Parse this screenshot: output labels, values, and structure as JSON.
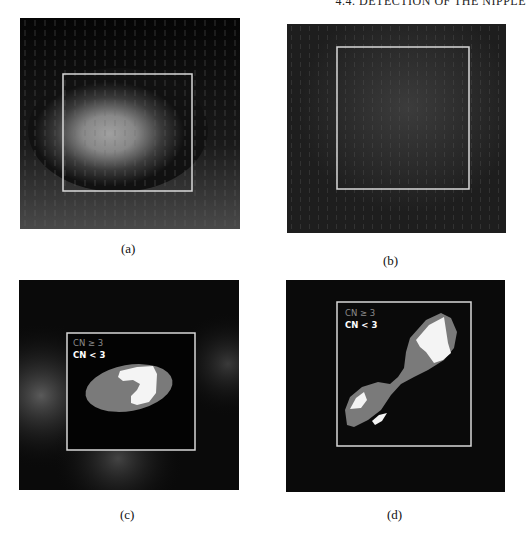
{
  "header": {
    "running_title": "4.4. DETECTION OF THE NIPPLE"
  },
  "figure": {
    "panels": [
      {
        "id": "a",
        "caption": "(a)",
        "description": "Gradient vector field over mammogram region with bright central blob and ROI box"
      },
      {
        "id": "b",
        "caption": "(b)",
        "description": "Dark gradient field with ROI box"
      },
      {
        "id": "c",
        "caption": "(c)",
        "description": "Segmented region colored by CN value within ROI box",
        "legend": {
          "ge": "CN ≥ 3",
          "lt": "CN < 3"
        }
      },
      {
        "id": "d",
        "caption": "(d)",
        "description": "Diagonal segmented region colored by CN value within ROI box",
        "legend": {
          "ge": "CN ≥ 3",
          "lt": "CN < 3"
        }
      }
    ],
    "colors": {
      "background_dark": "#0a0a0a",
      "roi_box": "#d8d8d8",
      "cn_ge_3": "#7a7a7a",
      "cn_lt_3": "#f4f4f4"
    }
  }
}
